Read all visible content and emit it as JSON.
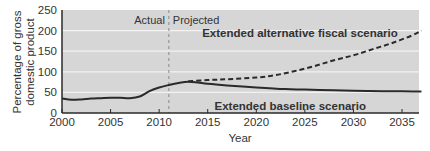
{
  "chart_data": {
    "type": "line",
    "title": "",
    "xlabel": "Year",
    "ylabel": "Percentage of gross domestic product",
    "ylabel_lines": [
      "Percentage of gross",
      "domestic product"
    ],
    "xlim": [
      2000,
      2037
    ],
    "ylim": [
      0,
      250
    ],
    "xticks": [
      2000,
      2005,
      2010,
      2015,
      2020,
      2025,
      2030,
      2035
    ],
    "yticks": [
      0,
      50,
      100,
      150,
      200,
      250
    ],
    "grid": true,
    "divider": {
      "x": 2011,
      "left_label": "Actual",
      "right_label": "Projected"
    },
    "series": [
      {
        "name": "Extended baseline scenario",
        "style": "solid",
        "x": [
          2000,
          2001,
          2002,
          2003,
          2004,
          2005,
          2006,
          2007,
          2008,
          2009,
          2010,
          2011,
          2012,
          2013,
          2014,
          2015,
          2017,
          2020,
          2023,
          2025,
          2028,
          2030,
          2033,
          2035,
          2037
        ],
        "values": [
          35,
          32,
          33,
          35,
          36,
          37,
          37,
          36,
          40,
          53,
          62,
          68,
          73,
          76,
          74,
          71,
          67,
          62,
          58,
          57,
          55,
          54,
          53,
          53,
          52
        ]
      },
      {
        "name": "Extended alternative fiscal scenario",
        "style": "dashed",
        "x": [
          2013,
          2015,
          2017,
          2020,
          2022,
          2024,
          2026,
          2028,
          2030,
          2032,
          2034,
          2036,
          2037
        ],
        "values": [
          77,
          80,
          82,
          86,
          92,
          102,
          114,
          128,
          140,
          155,
          170,
          188,
          200
        ]
      }
    ],
    "annotations": [
      {
        "text": "Extended alternative fiscal scenario",
        "x": 2024.5,
        "y": 195
      },
      {
        "text": "Extended baseline scenario",
        "x": 2023.5,
        "y": 18
      }
    ]
  },
  "colors": {
    "plot_bg": "#d6d6d6",
    "grid": "#f2f2f2",
    "line": "#2a2a2a",
    "text": "#333333",
    "divider": "#8a8a8a"
  }
}
